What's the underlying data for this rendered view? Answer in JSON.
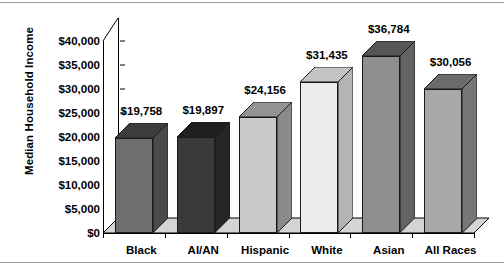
{
  "chart_data": {
    "type": "bar",
    "title": "",
    "subtitle": "",
    "xlabel": "",
    "ylabel": "Median Household Income",
    "categories": [
      "Black",
      "AI/AN",
      "Hispanic",
      "White",
      "Asian",
      "All Races"
    ],
    "values": [
      19758,
      19897,
      24156,
      31435,
      36784,
      30056
    ],
    "value_labels": [
      "$19,758",
      "$19,897",
      "$24,156",
      "$31,435",
      "$36,784",
      "$30,056"
    ],
    "ylim": [
      0,
      40000
    ],
    "ytick_values": [
      0,
      5000,
      10000,
      15000,
      20000,
      25000,
      30000,
      35000,
      40000
    ],
    "ytick_labels": [
      "$0",
      "$5,000",
      "$10,000",
      "$15,000",
      "$20,000",
      "$25,000",
      "$30,000",
      "$35,000",
      "$40,000"
    ],
    "grid": false,
    "legend": false,
    "legend_position": "none",
    "style": "3d-column",
    "bar_colors": [
      "#6e6e6e",
      "#3a3a3a",
      "#c9c9c9",
      "#ececec",
      "#8f8f8f",
      "#a8a8a8"
    ],
    "bar_side_colors": [
      "#4a4a4a",
      "#262626",
      "#8a8a8a",
      "#b4b4b4",
      "#636363",
      "#777777"
    ],
    "bar_top_colors": [
      "#3d3d3d",
      "#1f1f1f",
      "#949494",
      "#c4c4c4",
      "#565656",
      "#6b6b6b"
    ]
  },
  "axis": {
    "floor_color": "#d4d4d4",
    "line_color": "#000000"
  }
}
